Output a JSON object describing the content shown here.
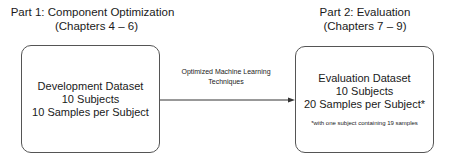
{
  "part1": {
    "title": "Part 1: Component Optimization",
    "chapters": "(Chapters 4 – 6)"
  },
  "part2": {
    "title": "Part 2: Evaluation",
    "chapters": "(Chapters 7 – 9)"
  },
  "development_box": {
    "lines": [
      "Development Dataset",
      "10 Subjects",
      "10 Samples per Subject"
    ]
  },
  "evaluation_box": {
    "lines": [
      "Evaluation Dataset",
      "10 Subjects",
      "20 Samples per Subject*"
    ],
    "footnote": "*with one subject containing 19 samples"
  },
  "arrow": {
    "label_lines": [
      "Optimized Machine Learning",
      "Techniques"
    ]
  },
  "colors": {
    "border": "#555555",
    "text": "#1a1a1a",
    "background": "#ffffff"
  }
}
